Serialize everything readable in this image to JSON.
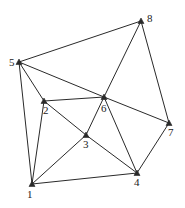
{
  "diagram": {
    "type": "network-graph",
    "nodes": [
      {
        "id": "1",
        "label": "1",
        "x": 32,
        "y": 184,
        "lx": 27,
        "ly": 198
      },
      {
        "id": "2",
        "label": "2",
        "x": 44,
        "y": 101,
        "lx": 43,
        "ly": 114
      },
      {
        "id": "3",
        "label": "3",
        "x": 86,
        "y": 135,
        "lx": 83,
        "ly": 148
      },
      {
        "id": "4",
        "label": "4",
        "x": 137,
        "y": 173,
        "lx": 134,
        "ly": 186
      },
      {
        "id": "5",
        "label": "5",
        "x": 19,
        "y": 62,
        "lx": 9,
        "ly": 66
      },
      {
        "id": "6",
        "label": "6",
        "x": 104,
        "y": 97,
        "lx": 101,
        "ly": 112
      },
      {
        "id": "7",
        "label": "7",
        "x": 169,
        "y": 123,
        "lx": 168,
        "ly": 136
      },
      {
        "id": "8",
        "label": "8",
        "x": 141,
        "y": 21,
        "lx": 147,
        "ly": 22
      }
    ],
    "edges": [
      [
        "5",
        "8"
      ],
      [
        "5",
        "6"
      ],
      [
        "6",
        "7"
      ],
      [
        "5",
        "2"
      ],
      [
        "5",
        "1"
      ],
      [
        "8",
        "6"
      ],
      [
        "8",
        "7"
      ],
      [
        "2",
        "6"
      ],
      [
        "2",
        "1"
      ],
      [
        "2",
        "3"
      ],
      [
        "3",
        "4"
      ],
      [
        "6",
        "3"
      ],
      [
        "6",
        "4"
      ],
      [
        "3",
        "1"
      ],
      [
        "1",
        "4"
      ],
      [
        "4",
        "7"
      ]
    ]
  }
}
